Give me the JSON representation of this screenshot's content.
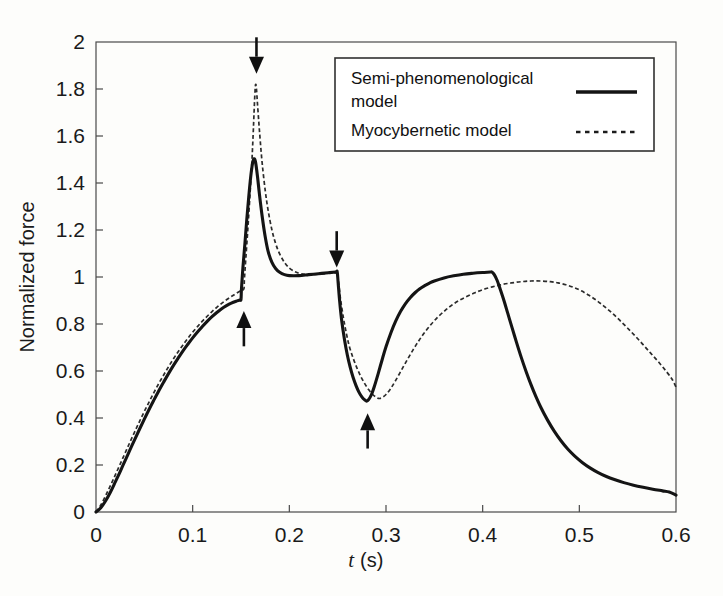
{
  "figure": {
    "background_color": "#fdfdfb",
    "foreground_color": "#141414"
  },
  "chart_data": {
    "type": "line",
    "title": "",
    "xlabel": "t (s)",
    "xlabel_symbol": "t",
    "xlabel_unit": "(s)",
    "ylabel": "Normalized force",
    "xlim": [
      0,
      0.6
    ],
    "ylim": [
      0,
      2
    ],
    "xticks": [
      0,
      0.1,
      0.2,
      0.3,
      0.4,
      0.5,
      0.6
    ],
    "xtick_labels": [
      "0",
      "0.1",
      "0.2",
      "0.3",
      "0.4",
      "0.5",
      "0.6"
    ],
    "yticks": [
      0,
      0.2,
      0.4,
      0.6,
      0.8,
      1.0,
      1.2,
      1.4,
      1.6,
      1.8,
      2.0
    ],
    "ytick_labels": [
      "0",
      "0.2",
      "0.4",
      "0.6",
      "0.8",
      "1",
      "1.2",
      "1.4",
      "1.6",
      "1.8",
      "2"
    ],
    "grid": false,
    "legend_position": "top-right",
    "series": [
      {
        "name": "Semi-phenomenological model",
        "style": "solid",
        "color": "#141414",
        "points": [
          [
            0.0,
            0.0
          ],
          [
            0.005,
            0.018
          ],
          [
            0.01,
            0.048
          ],
          [
            0.015,
            0.085
          ],
          [
            0.02,
            0.128
          ],
          [
            0.025,
            0.172
          ],
          [
            0.03,
            0.218
          ],
          [
            0.035,
            0.263
          ],
          [
            0.04,
            0.308
          ],
          [
            0.045,
            0.352
          ],
          [
            0.05,
            0.395
          ],
          [
            0.055,
            0.437
          ],
          [
            0.06,
            0.477
          ],
          [
            0.065,
            0.516
          ],
          [
            0.07,
            0.553
          ],
          [
            0.075,
            0.589
          ],
          [
            0.08,
            0.623
          ],
          [
            0.085,
            0.655
          ],
          [
            0.09,
            0.686
          ],
          [
            0.095,
            0.714
          ],
          [
            0.1,
            0.741
          ],
          [
            0.105,
            0.766
          ],
          [
            0.11,
            0.789
          ],
          [
            0.115,
            0.811
          ],
          [
            0.12,
            0.831
          ],
          [
            0.125,
            0.849
          ],
          [
            0.13,
            0.865
          ],
          [
            0.135,
            0.878
          ],
          [
            0.14,
            0.889
          ],
          [
            0.145,
            0.897
          ],
          [
            0.149,
            0.902
          ],
          [
            0.15,
            0.905
          ],
          [
            0.1505,
            0.95
          ],
          [
            0.152,
            1.04
          ],
          [
            0.154,
            1.14
          ],
          [
            0.156,
            1.245
          ],
          [
            0.158,
            1.34
          ],
          [
            0.16,
            1.425
          ],
          [
            0.162,
            1.485
          ],
          [
            0.1635,
            1.503
          ],
          [
            0.165,
            1.49
          ],
          [
            0.167,
            1.43
          ],
          [
            0.169,
            1.355
          ],
          [
            0.172,
            1.255
          ],
          [
            0.175,
            1.172
          ],
          [
            0.178,
            1.11
          ],
          [
            0.182,
            1.062
          ],
          [
            0.186,
            1.035
          ],
          [
            0.19,
            1.02
          ],
          [
            0.195,
            1.01
          ],
          [
            0.2,
            1.006
          ],
          [
            0.21,
            1.006
          ],
          [
            0.22,
            1.01
          ],
          [
            0.23,
            1.014
          ],
          [
            0.24,
            1.018
          ],
          [
            0.248,
            1.021
          ],
          [
            0.2495,
            1.022
          ],
          [
            0.2505,
            0.975
          ],
          [
            0.252,
            0.9
          ],
          [
            0.254,
            0.82
          ],
          [
            0.257,
            0.735
          ],
          [
            0.26,
            0.668
          ],
          [
            0.263,
            0.615
          ],
          [
            0.266,
            0.572
          ],
          [
            0.269,
            0.538
          ],
          [
            0.272,
            0.51
          ],
          [
            0.275,
            0.49
          ],
          [
            0.278,
            0.477
          ],
          [
            0.28,
            0.472
          ],
          [
            0.282,
            0.478
          ],
          [
            0.285,
            0.5
          ],
          [
            0.288,
            0.535
          ],
          [
            0.292,
            0.59
          ],
          [
            0.296,
            0.648
          ],
          [
            0.3,
            0.703
          ],
          [
            0.305,
            0.762
          ],
          [
            0.31,
            0.812
          ],
          [
            0.315,
            0.853
          ],
          [
            0.32,
            0.886
          ],
          [
            0.325,
            0.912
          ],
          [
            0.33,
            0.933
          ],
          [
            0.335,
            0.95
          ],
          [
            0.34,
            0.963
          ],
          [
            0.345,
            0.974
          ],
          [
            0.35,
            0.983
          ],
          [
            0.36,
            0.996
          ],
          [
            0.37,
            1.005
          ],
          [
            0.38,
            1.012
          ],
          [
            0.39,
            1.016
          ],
          [
            0.4,
            1.019
          ],
          [
            0.408,
            1.021
          ],
          [
            0.4095,
            1.021
          ],
          [
            0.412,
            1.01
          ],
          [
            0.415,
            0.985
          ],
          [
            0.418,
            0.95
          ],
          [
            0.422,
            0.9
          ],
          [
            0.426,
            0.845
          ],
          [
            0.43,
            0.79
          ],
          [
            0.435,
            0.722
          ],
          [
            0.44,
            0.657
          ],
          [
            0.445,
            0.597
          ],
          [
            0.45,
            0.542
          ],
          [
            0.455,
            0.492
          ],
          [
            0.46,
            0.447
          ],
          [
            0.467,
            0.392
          ],
          [
            0.474,
            0.344
          ],
          [
            0.481,
            0.303
          ],
          [
            0.488,
            0.268
          ],
          [
            0.495,
            0.239
          ],
          [
            0.503,
            0.211
          ],
          [
            0.511,
            0.188
          ],
          [
            0.519,
            0.169
          ],
          [
            0.528,
            0.151
          ],
          [
            0.537,
            0.137
          ],
          [
            0.546,
            0.125
          ],
          [
            0.556,
            0.114
          ],
          [
            0.566,
            0.105
          ],
          [
            0.576,
            0.097
          ],
          [
            0.586,
            0.09
          ],
          [
            0.593,
            0.085
          ],
          [
            0.6,
            0.072
          ]
        ]
      },
      {
        "name": "Myocybernetic model",
        "style": "dashed",
        "color": "#2b2b2b",
        "points": [
          [
            0.0,
            0.0
          ],
          [
            0.005,
            0.03
          ],
          [
            0.01,
            0.07
          ],
          [
            0.015,
            0.113
          ],
          [
            0.02,
            0.158
          ],
          [
            0.025,
            0.204
          ],
          [
            0.03,
            0.25
          ],
          [
            0.035,
            0.296
          ],
          [
            0.04,
            0.341
          ],
          [
            0.045,
            0.385
          ],
          [
            0.05,
            0.428
          ],
          [
            0.055,
            0.469
          ],
          [
            0.06,
            0.509
          ],
          [
            0.065,
            0.547
          ],
          [
            0.07,
            0.583
          ],
          [
            0.075,
            0.618
          ],
          [
            0.08,
            0.651
          ],
          [
            0.085,
            0.682
          ],
          [
            0.09,
            0.711
          ],
          [
            0.095,
            0.739
          ],
          [
            0.1,
            0.765
          ],
          [
            0.105,
            0.789
          ],
          [
            0.11,
            0.812
          ],
          [
            0.115,
            0.833
          ],
          [
            0.12,
            0.853
          ],
          [
            0.125,
            0.871
          ],
          [
            0.13,
            0.888
          ],
          [
            0.135,
            0.903
          ],
          [
            0.14,
            0.917
          ],
          [
            0.145,
            0.93
          ],
          [
            0.15,
            0.942
          ],
          [
            0.153,
            0.95
          ],
          [
            0.1535,
            0.99
          ],
          [
            0.155,
            1.08
          ],
          [
            0.157,
            1.2
          ],
          [
            0.159,
            1.33
          ],
          [
            0.161,
            1.47
          ],
          [
            0.1625,
            1.6
          ],
          [
            0.1635,
            1.7
          ],
          [
            0.1645,
            1.79
          ],
          [
            0.1652,
            1.82
          ],
          [
            0.166,
            1.8
          ],
          [
            0.167,
            1.74
          ],
          [
            0.1685,
            1.655
          ],
          [
            0.17,
            1.575
          ],
          [
            0.172,
            1.48
          ],
          [
            0.175,
            1.37
          ],
          [
            0.178,
            1.285
          ],
          [
            0.182,
            1.2
          ],
          [
            0.186,
            1.14
          ],
          [
            0.19,
            1.098
          ],
          [
            0.195,
            1.062
          ],
          [
            0.2,
            1.038
          ],
          [
            0.206,
            1.022
          ],
          [
            0.212,
            1.014
          ],
          [
            0.22,
            1.01
          ],
          [
            0.23,
            1.012
          ],
          [
            0.24,
            1.016
          ],
          [
            0.248,
            1.019
          ],
          [
            0.2495,
            1.02
          ],
          [
            0.251,
            0.975
          ],
          [
            0.253,
            0.905
          ],
          [
            0.256,
            0.825
          ],
          [
            0.259,
            0.76
          ],
          [
            0.262,
            0.706
          ],
          [
            0.266,
            0.655
          ],
          [
            0.27,
            0.612
          ],
          [
            0.274,
            0.576
          ],
          [
            0.278,
            0.546
          ],
          [
            0.282,
            0.521
          ],
          [
            0.286,
            0.501
          ],
          [
            0.29,
            0.488
          ],
          [
            0.293,
            0.483
          ],
          [
            0.296,
            0.487
          ],
          [
            0.3,
            0.5
          ],
          [
            0.305,
            0.526
          ],
          [
            0.31,
            0.56
          ],
          [
            0.316,
            0.604
          ],
          [
            0.322,
            0.648
          ],
          [
            0.328,
            0.69
          ],
          [
            0.334,
            0.729
          ],
          [
            0.34,
            0.764
          ],
          [
            0.347,
            0.8
          ],
          [
            0.354,
            0.831
          ],
          [
            0.361,
            0.857
          ],
          [
            0.368,
            0.88
          ],
          [
            0.376,
            0.901
          ],
          [
            0.384,
            0.918
          ],
          [
            0.392,
            0.933
          ],
          [
            0.4,
            0.946
          ],
          [
            0.41,
            0.958
          ],
          [
            0.42,
            0.968
          ],
          [
            0.43,
            0.975
          ],
          [
            0.44,
            0.98
          ],
          [
            0.45,
            0.983
          ],
          [
            0.46,
            0.983
          ],
          [
            0.47,
            0.98
          ],
          [
            0.478,
            0.975
          ],
          [
            0.486,
            0.967
          ],
          [
            0.494,
            0.956
          ],
          [
            0.502,
            0.941
          ],
          [
            0.51,
            0.922
          ],
          [
            0.518,
            0.9
          ],
          [
            0.526,
            0.874
          ],
          [
            0.534,
            0.846
          ],
          [
            0.542,
            0.815
          ],
          [
            0.55,
            0.782
          ],
          [
            0.558,
            0.748
          ],
          [
            0.566,
            0.712
          ],
          [
            0.574,
            0.675
          ],
          [
            0.582,
            0.638
          ],
          [
            0.59,
            0.598
          ],
          [
            0.596,
            0.565
          ],
          [
            0.6,
            0.532
          ]
        ]
      }
    ],
    "annotations": [
      {
        "name": "arrow-1",
        "direction": "down",
        "x": 0.166,
        "y_tip": 1.865,
        "y_tail": 2.02,
        "label": ""
      },
      {
        "name": "arrow-2",
        "direction": "up",
        "x": 0.153,
        "y_tip": 0.855,
        "y_tail": 0.705,
        "label": ""
      },
      {
        "name": "arrow-3",
        "direction": "down",
        "x": 0.249,
        "y_tip": 1.04,
        "y_tail": 1.195,
        "label": ""
      },
      {
        "name": "arrow-4",
        "direction": "up",
        "x": 0.281,
        "y_tip": 0.42,
        "y_tail": 0.27,
        "label": ""
      }
    ]
  },
  "legend": {
    "entries": [
      {
        "label": "Semi-phenomenological model",
        "style": "solid"
      },
      {
        "label": "Myocybernetic model",
        "style": "dashed"
      }
    ]
  }
}
